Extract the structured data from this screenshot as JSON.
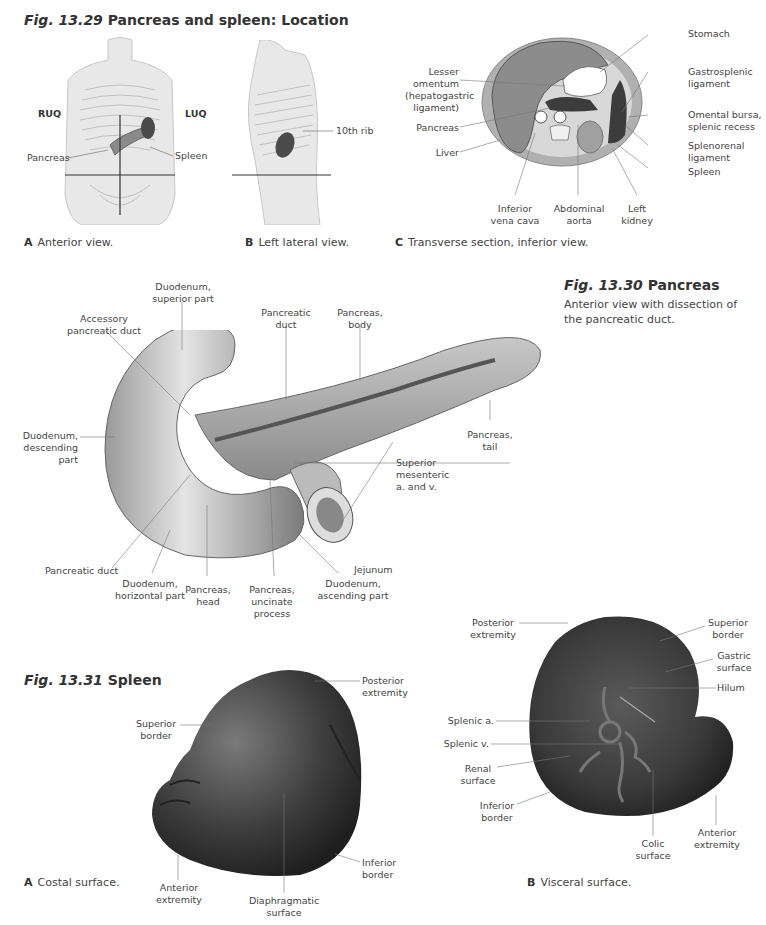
{
  "fig_13_29": {
    "number": "Fig. 13.29",
    "title": "Pancreas and spleen: Location",
    "panel_a": {
      "letter": "A",
      "caption": "Anterior view.",
      "labels": {
        "ruq": "RUQ",
        "luq": "LUQ",
        "pancreas": "Pancreas",
        "spleen": "Spleen"
      }
    },
    "panel_b": {
      "letter": "B",
      "caption": "Left lateral view.",
      "labels": {
        "rib": "10th rib"
      }
    },
    "panel_c": {
      "letter": "C",
      "caption": "Transverse section, inferior view.",
      "labels": {
        "stomach": "Stomach",
        "lesser_omentum": "Lesser\nomentum\n(hepatogastric\nligament)",
        "gastrosplenic": "Gastrosplenic\nligament",
        "pancreas": "Pancreas",
        "omental_bursa": "Omental bursa,\nsplenic recess",
        "liver": "Liver",
        "splenorenal": "Splenorenal\nligament",
        "spleen": "Spleen",
        "ivc": "Inferior\nvena cava",
        "aorta": "Abdominal\naorta",
        "left_kidney": "Left\nkidney"
      }
    }
  },
  "fig_13_30": {
    "number": "Fig. 13.30",
    "title": "Pancreas",
    "subtitle": "Anterior view with dissection of the pancreatic duct.",
    "labels": {
      "duod_superior": "Duodenum,\nsuperior part",
      "accessory_duct": "Accessory\npancreatic duct",
      "pancreatic_duct_top": "Pancreatic\nduct",
      "pancreas_body": "Pancreas,\nbody",
      "duod_descending": "Duodenum,\ndescending\npart",
      "pancreas_tail": "Pancreas,\ntail",
      "sup_mesenteric": "Superior\nmesenteric\na. and v.",
      "jejunum": "Jejunum",
      "pancreatic_duct_bottom": "Pancreatic duct",
      "duod_horizontal": "Duodenum,\nhorizontal part",
      "pancreas_head": "Pancreas,\nhead",
      "uncinate": "Pancreas,\nuncinate process",
      "duod_ascending": "Duodenum,\nascending part"
    }
  },
  "fig_13_31": {
    "number": "Fig. 13.31",
    "title": "Spleen",
    "panel_a": {
      "letter": "A",
      "caption": "Costal surface.",
      "labels": {
        "posterior_extremity": "Posterior\nextremity",
        "superior_border": "Superior\nborder",
        "inferior_border": "Inferior\nborder",
        "anterior_extremity": "Anterior\nextremity",
        "diaphragmatic": "Diaphragmatic\nsurface"
      }
    },
    "panel_b": {
      "letter": "B",
      "caption": "Visceral surface.",
      "labels": {
        "posterior_extremity": "Posterior\nextremity",
        "superior_border": "Superior\nborder",
        "gastric_surface": "Gastric\nsurface",
        "hilum": "Hilum",
        "splenic_a": "Splenic a.",
        "splenic_v": "Splenic v.",
        "renal_surface": "Renal\nsurface",
        "inferior_border": "Inferior\nborder",
        "colic_surface": "Colic\nsurface",
        "anterior_extremity": "Anterior\nextremity"
      }
    }
  },
  "colors": {
    "text": "#444444",
    "title": "#333333",
    "leader_line": "#888888",
    "organ_dark": "#3c3c3c",
    "organ_mid": "#8a8a8a",
    "organ_light": "#d4d4d4"
  }
}
